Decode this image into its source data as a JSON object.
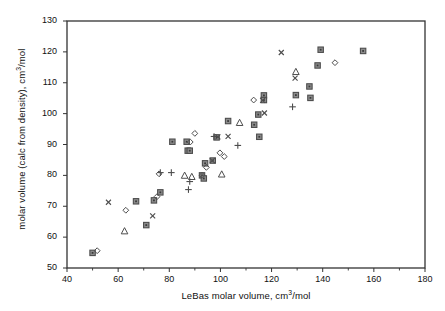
{
  "chart_data": {
    "type": "scatter",
    "title": "",
    "xlabel": "LeBas molar volume, cm3/mol",
    "xlabel_parts": {
      "pre": "LeBas molar volume, cm",
      "sup": "3",
      "post": "/mol"
    },
    "ylabel": "molar volume (calc from density), cm3/mol",
    "ylabel_parts": {
      "pre": "molar volume (calc from density), cm",
      "sup": "3",
      "post": "/mol"
    },
    "xlim": [
      40,
      180
    ],
    "ylim": [
      50,
      130
    ],
    "xticks": [
      40,
      60,
      80,
      100,
      120,
      140,
      160,
      180
    ],
    "yticks": [
      50,
      60,
      70,
      80,
      90,
      100,
      110,
      120,
      130
    ],
    "xminorticks": [
      50,
      70,
      90,
      110,
      130,
      150,
      170
    ],
    "grid": false,
    "legend_position": "lower right",
    "marker_color": "#4d4d4d",
    "axis_color": "#333333",
    "series": [
      {
        "name": "chloroalkanes",
        "marker": "square",
        "points": [
          [
            50.0,
            54.9
          ],
          [
            71.0,
            63.9
          ],
          [
            74.0,
            71.9
          ],
          [
            67.0,
            71.6
          ],
          [
            76.5,
            74.5
          ],
          [
            81.2,
            90.9
          ],
          [
            86.8,
            90.9
          ],
          [
            87.2,
            88.0
          ],
          [
            88.0,
            88.0
          ],
          [
            92.8,
            80.0
          ],
          [
            93.5,
            79.0
          ],
          [
            94.0,
            83.9
          ],
          [
            97.0,
            84.8
          ],
          [
            98.5,
            92.3
          ],
          [
            103.0,
            97.6
          ],
          [
            113.2,
            96.4
          ],
          [
            114.8,
            99.7
          ],
          [
            115.2,
            92.5
          ],
          [
            117.0,
            105.9
          ],
          [
            117.0,
            104.4
          ],
          [
            129.5,
            106.0
          ],
          [
            134.8,
            108.8
          ],
          [
            135.2,
            105.1
          ],
          [
            138.0,
            115.6
          ],
          [
            139.2,
            120.7
          ],
          [
            155.8,
            120.3
          ]
        ]
      },
      {
        "name": "chloroalkenes",
        "marker": "plus",
        "points": [
          [
            76.5,
            80.9
          ],
          [
            80.8,
            80.9
          ],
          [
            87.5,
            75.4
          ],
          [
            88.0,
            78.0
          ],
          [
            97.5,
            92.6
          ],
          [
            106.8,
            89.7
          ],
          [
            128.2,
            102.2
          ]
        ]
      },
      {
        "name": "bromoalkanes",
        "marker": "diamond",
        "points": [
          [
            51.8,
            55.6
          ],
          [
            63.0,
            68.7
          ],
          [
            75.2,
            73.1
          ],
          [
            76.0,
            80.5
          ],
          [
            88.2,
            90.8
          ],
          [
            90.0,
            93.6
          ],
          [
            92.8,
            80.0
          ],
          [
            94.5,
            82.6
          ],
          [
            99.8,
            87.3
          ],
          [
            101.5,
            86.1
          ],
          [
            113.0,
            104.4
          ],
          [
            144.8,
            116.5
          ]
        ]
      },
      {
        "name": "iodoalkanes",
        "marker": "triangle",
        "points": [
          [
            62.5,
            62.0
          ],
          [
            86.0,
            80.0
          ],
          [
            88.8,
            79.6
          ],
          [
            100.5,
            80.4
          ],
          [
            107.5,
            97.1
          ],
          [
            129.5,
            113.6
          ]
        ]
      },
      {
        "name": "mixed halides",
        "marker": "cross",
        "points": [
          [
            56.2,
            71.3
          ],
          [
            73.5,
            66.9
          ],
          [
            96.8,
            84.8
          ],
          [
            99.0,
            92.5
          ],
          [
            103.0,
            92.6
          ],
          [
            116.5,
            104.3
          ],
          [
            117.2,
            100.2
          ],
          [
            123.8,
            119.8
          ],
          [
            129.2,
            111.5
          ]
        ]
      }
    ]
  },
  "legend": {
    "entries": [
      {
        "label": "chloroalkanes",
        "marker": "square"
      },
      {
        "label": "chloroalkenes",
        "marker": "plus"
      },
      {
        "label": "bromoalkanes",
        "marker": "diamond"
      },
      {
        "label": "iodoalkanes",
        "marker": "triangle"
      },
      {
        "label": "mixed halides",
        "marker": "cross"
      }
    ]
  }
}
